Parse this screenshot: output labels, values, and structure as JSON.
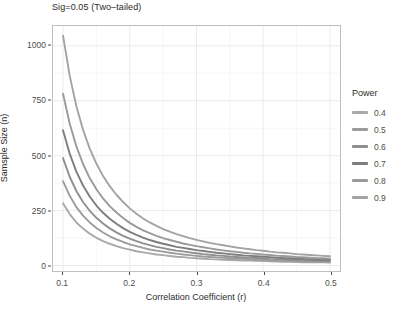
{
  "chart_data": {
    "type": "line",
    "title": "",
    "subtitle": "Sig=0.05 (Two–tailed)",
    "xlabel": "Correlation Coefficient (r)",
    "ylabel": "Samsple Size (n)",
    "xlim": [
      0.085,
      0.515
    ],
    "ylim": [
      -25,
      1090
    ],
    "xticks": [
      0.1,
      0.2,
      0.3,
      0.4,
      0.5
    ],
    "xtick_labels": [
      "0.1",
      "0.2",
      "0.3",
      "0.4",
      "0.5"
    ],
    "yticks": [
      0,
      250,
      500,
      750,
      1000
    ],
    "ytick_labels": [
      "0",
      "250",
      "500",
      "750",
      "1000"
    ],
    "grid": true,
    "grid_minor": true,
    "legend_position": "right",
    "legend_title": "Power",
    "x": [
      0.1,
      0.11,
      0.12,
      0.13,
      0.14,
      0.15,
      0.16,
      0.17,
      0.18,
      0.19,
      0.2,
      0.21,
      0.22,
      0.23,
      0.24,
      0.25,
      0.26,
      0.27,
      0.28,
      0.29,
      0.3,
      0.31,
      0.32,
      0.33,
      0.34,
      0.35,
      0.36,
      0.37,
      0.38,
      0.39,
      0.4,
      0.41,
      0.42,
      0.43,
      0.44,
      0.45,
      0.46,
      0.47,
      0.48,
      0.49,
      0.5
    ],
    "series": [
      {
        "name": "0.4",
        "color": "#a8a8a8",
        "values": [
          283,
          234,
          196,
          168,
          145,
          126,
          111,
          99,
          88,
          79,
          72,
          65,
          60,
          55,
          50,
          47,
          43,
          40,
          38,
          35,
          33,
          31,
          29,
          28,
          26,
          25,
          24,
          23,
          22,
          21,
          20,
          19,
          18,
          17,
          17,
          16,
          15,
          15,
          14,
          14,
          13
        ]
      },
      {
        "name": "0.5",
        "color": "#9c9c9c",
        "values": [
          384,
          317,
          266,
          227,
          196,
          171,
          150,
          133,
          119,
          107,
          96,
          88,
          80,
          73,
          68,
          63,
          58,
          54,
          50,
          47,
          44,
          41,
          39,
          37,
          35,
          33,
          31,
          30,
          28,
          27,
          26,
          24,
          23,
          22,
          21,
          20,
          20,
          19,
          18,
          17,
          17
        ]
      },
      {
        "name": "0.6",
        "color": "#8f8f8f",
        "values": [
          489,
          404,
          339,
          289,
          249,
          217,
          191,
          169,
          151,
          135,
          122,
          111,
          101,
          93,
          85,
          79,
          73,
          68,
          64,
          60,
          56,
          52,
          49,
          46,
          44,
          41,
          39,
          37,
          35,
          34,
          32,
          30,
          29,
          28,
          26,
          25,
          24,
          23,
          22,
          21,
          21
        ]
      },
      {
        "name": "0.7",
        "color": "#7d7d7d",
        "values": [
          616,
          509,
          427,
          364,
          314,
          273,
          240,
          213,
          190,
          170,
          153,
          139,
          127,
          116,
          107,
          99,
          92,
          85,
          80,
          75,
          70,
          66,
          62,
          58,
          55,
          52,
          49,
          46,
          44,
          42,
          40,
          38,
          36,
          34,
          33,
          31,
          30,
          29,
          27,
          26,
          25
        ]
      },
      {
        "name": "0.8",
        "color": "#9a9a9a",
        "values": [
          782,
          646,
          542,
          462,
          398,
          347,
          305,
          270,
          241,
          216,
          194,
          176,
          160,
          147,
          135,
          125,
          116,
          108,
          100,
          94,
          88,
          83,
          78,
          73,
          69,
          65,
          62,
          58,
          55,
          53,
          50,
          48,
          45,
          43,
          41,
          39,
          38,
          36,
          34,
          33,
          31
        ]
      },
      {
        "name": "0.9",
        "color": "#a3a3a3",
        "values": [
          1046,
          864,
          725,
          618,
          532,
          464,
          407,
          361,
          322,
          289,
          260,
          236,
          214,
          196,
          180,
          166,
          154,
          143,
          134,
          125,
          117,
          110,
          103,
          97,
          92,
          87,
          82,
          78,
          74,
          70,
          67,
          63,
          60,
          58,
          55,
          52,
          50,
          48,
          46,
          44,
          42
        ]
      }
    ]
  },
  "legend": {
    "title": "Power",
    "items": [
      {
        "label": "0.4",
        "color": "#a8a8a8"
      },
      {
        "label": "0.5",
        "color": "#9c9c9c"
      },
      {
        "label": "0.6",
        "color": "#8f8f8f"
      },
      {
        "label": "0.7",
        "color": "#7d7d7d"
      },
      {
        "label": "0.8",
        "color": "#9a9a9a"
      },
      {
        "label": "0.9",
        "color": "#a3a3a3"
      }
    ]
  },
  "theme": {
    "panel_background": "#ffffff",
    "panel_border": "#bfbfbf",
    "grid_major": "#ebebeb",
    "grid_minor": "#f4f4f4",
    "text_color": "#4d4d4d"
  }
}
